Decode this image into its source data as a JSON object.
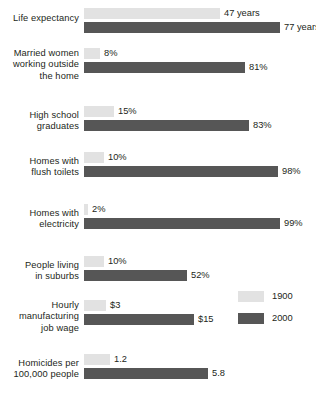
{
  "chart_data": {
    "type": "bar",
    "title": "",
    "subtitle": "",
    "xlabel": "",
    "ylabel": "",
    "orientation": "horizontal",
    "grid": false,
    "legend_position": "right-middle",
    "categories": [
      "Life expectancy",
      "Married women working outside the home",
      "High school graduates",
      "Homes with flush toilets",
      "Homes with electricity",
      "People living in suburbs",
      "Hourly manufacturing job wage",
      "Homicides per 100,000 people"
    ],
    "series": [
      {
        "name": "1900",
        "color": "#e2e2e2",
        "values": [
          47,
          8,
          15,
          10,
          2,
          10,
          3,
          1.2
        ],
        "labels": [
          "47 years",
          "8%",
          "15%",
          "10%",
          "2%",
          "10%",
          "$3",
          "1.2"
        ]
      },
      {
        "name": "2000",
        "color": "#565656",
        "values": [
          77,
          81,
          83,
          98,
          99,
          52,
          15,
          5.8
        ],
        "labels": [
          "77 years",
          "81%",
          "83%",
          "98%",
          "99%",
          "52%",
          "$15",
          "5.8"
        ]
      }
    ]
  },
  "groups": [
    {
      "label_lines": [
        "Life expectancy"
      ],
      "scale": "years",
      "bars": [
        {
          "series": "1900",
          "value": 47,
          "label": "47 years",
          "px": 136
        },
        {
          "series": "2000",
          "value": 77,
          "label": "77 years",
          "px": 196
        }
      ]
    },
    {
      "label_lines": [
        "Married women",
        "working outside",
        "the home"
      ],
      "scale": "percent",
      "bars": [
        {
          "series": "1900",
          "value": 8,
          "label": "8%",
          "px": 16
        },
        {
          "series": "2000",
          "value": 81,
          "label": "81%",
          "px": 161
        }
      ]
    },
    {
      "label_lines": [
        "High school",
        "graduates"
      ],
      "scale": "percent",
      "bars": [
        {
          "series": "1900",
          "value": 15,
          "label": "15%",
          "px": 30
        },
        {
          "series": "2000",
          "value": 83,
          "label": "83%",
          "px": 165
        }
      ]
    },
    {
      "label_lines": [
        "Homes with",
        "flush toilets"
      ],
      "scale": "percent",
      "bars": [
        {
          "series": "1900",
          "value": 10,
          "label": "10%",
          "px": 20
        },
        {
          "series": "2000",
          "value": 98,
          "label": "98%",
          "px": 194
        }
      ]
    },
    {
      "label_lines": [
        "Homes with",
        "electricity"
      ],
      "scale": "percent",
      "bars": [
        {
          "series": "1900",
          "value": 2,
          "label": "2%",
          "px": 4
        },
        {
          "series": "2000",
          "value": 99,
          "label": "99%",
          "px": 196
        }
      ]
    },
    {
      "label_lines": [
        "People living",
        "in suburbs"
      ],
      "scale": "percent",
      "bars": [
        {
          "series": "1900",
          "value": 10,
          "label": "10%",
          "px": 20
        },
        {
          "series": "2000",
          "value": 52,
          "label": "52%",
          "px": 103
        }
      ]
    },
    {
      "label_lines": [
        "Hourly",
        "manufacturing",
        "job wage"
      ],
      "scale": "dollars",
      "bars": [
        {
          "series": "1900",
          "value": 3,
          "label": "$3",
          "px": 22
        },
        {
          "series": "2000",
          "value": 15,
          "label": "$15",
          "px": 110
        }
      ]
    },
    {
      "label_lines": [
        "Homicides per",
        "100,000 people"
      ],
      "scale": "rate",
      "bars": [
        {
          "series": "1900",
          "value": 1.2,
          "label": "1.2",
          "px": 26
        },
        {
          "series": "2000",
          "value": 5.8,
          "label": "5.8",
          "px": 124
        }
      ]
    }
  ],
  "legend": {
    "items": [
      {
        "label": "1900",
        "color": "#e2e2e2"
      },
      {
        "label": "2000",
        "color": "#565656"
      }
    ]
  },
  "colors": {
    "series_1900": "#e2e2e2",
    "series_2000": "#565656",
    "text": "#231f20",
    "background": "#ffffff"
  }
}
